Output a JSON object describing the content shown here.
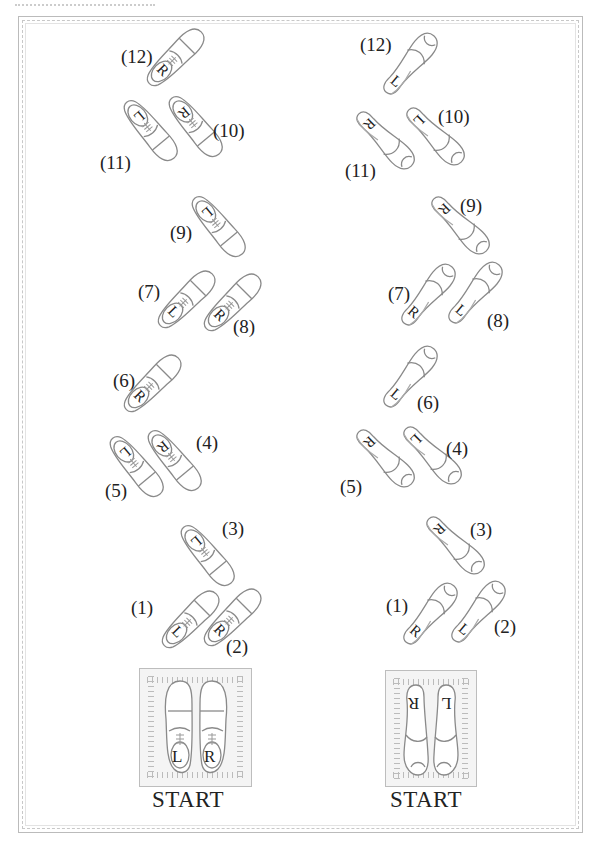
{
  "men": {
    "start_label": "START",
    "start_letters": {
      "left": "L",
      "right": "R"
    },
    "steps": [
      {
        "num": "(1)",
        "letter": "L",
        "x": 190,
        "y": 620,
        "rot": 45,
        "lx": 131,
        "ly": 597
      },
      {
        "num": "(2)",
        "letter": "R",
        "x": 232,
        "y": 618,
        "rot": 45,
        "lx": 226,
        "ly": 636
      },
      {
        "num": "(3)",
        "letter": "L",
        "x": 207,
        "y": 555,
        "rot": 140,
        "lx": 222,
        "ly": 518
      },
      {
        "num": "(4)",
        "letter": "R",
        "x": 174,
        "y": 460,
        "rot": 140,
        "lx": 196,
        "ly": 432
      },
      {
        "num": "(5)",
        "letter": "L",
        "x": 136,
        "y": 466,
        "rot": 140,
        "lx": 105,
        "ly": 480
      },
      {
        "num": "(6)",
        "letter": "R",
        "x": 152,
        "y": 384,
        "rot": 45,
        "lx": 113,
        "ly": 370
      },
      {
        "num": "(7)",
        "letter": "L",
        "x": 186,
        "y": 300,
        "rot": 45,
        "lx": 138,
        "ly": 281
      },
      {
        "num": "(8)",
        "letter": "R",
        "x": 232,
        "y": 303,
        "rot": 45,
        "lx": 233,
        "ly": 316
      },
      {
        "num": "(9)",
        "letter": "L",
        "x": 218,
        "y": 226,
        "rot": 140,
        "lx": 170,
        "ly": 222
      },
      {
        "num": "(10)",
        "letter": "R",
        "x": 195,
        "y": 126,
        "rot": 140,
        "lx": 213,
        "ly": 120
      },
      {
        "num": "(11)",
        "letter": "L",
        "x": 150,
        "y": 130,
        "rot": 140,
        "lx": 100,
        "ly": 152
      },
      {
        "num": "(12)",
        "letter": "R",
        "x": 175,
        "y": 58,
        "rot": 45,
        "lx": 121,
        "ly": 46
      }
    ]
  },
  "women": {
    "start_label": "START",
    "start_letters": {
      "left": "R",
      "right": "L"
    },
    "steps": [
      {
        "num": "(1)",
        "letter": "R",
        "x": 430,
        "y": 614,
        "rot": 220,
        "lx": 386,
        "ly": 595
      },
      {
        "num": "(2)",
        "letter": "L",
        "x": 478,
        "y": 612,
        "rot": 220,
        "lx": 494,
        "ly": 616
      },
      {
        "num": "(3)",
        "letter": "R",
        "x": 455,
        "y": 545,
        "rot": 315,
        "lx": 470,
        "ly": 519
      },
      {
        "num": "(4)",
        "letter": "L",
        "x": 432,
        "y": 455,
        "rot": 315,
        "lx": 446,
        "ly": 438
      },
      {
        "num": "(5)",
        "letter": "R",
        "x": 385,
        "y": 458,
        "rot": 315,
        "lx": 340,
        "ly": 476
      },
      {
        "num": "(6)",
        "letter": "L",
        "x": 410,
        "y": 377,
        "rot": 220,
        "lx": 417,
        "ly": 392
      },
      {
        "num": "(7)",
        "letter": "R",
        "x": 428,
        "y": 295,
        "rot": 220,
        "lx": 388,
        "ly": 283
      },
      {
        "num": "(8)",
        "letter": "L",
        "x": 475,
        "y": 293,
        "rot": 220,
        "lx": 487,
        "ly": 310
      },
      {
        "num": "(9)",
        "letter": "R",
        "x": 460,
        "y": 225,
        "rot": 315,
        "lx": 460,
        "ly": 195
      },
      {
        "num": "(10)",
        "letter": "L",
        "x": 435,
        "y": 136,
        "rot": 315,
        "lx": 438,
        "ly": 106
      },
      {
        "num": "(11)",
        "letter": "R",
        "x": 385,
        "y": 140,
        "rot": 315,
        "lx": 345,
        "ly": 160
      },
      {
        "num": "(12)",
        "letter": "L",
        "x": 410,
        "y": 64,
        "rot": 220,
        "lx": 360,
        "ly": 34
      }
    ]
  },
  "colors": {
    "outline": "#8a8a8a",
    "frame": "#bbbbbb",
    "text": "#222222"
  }
}
